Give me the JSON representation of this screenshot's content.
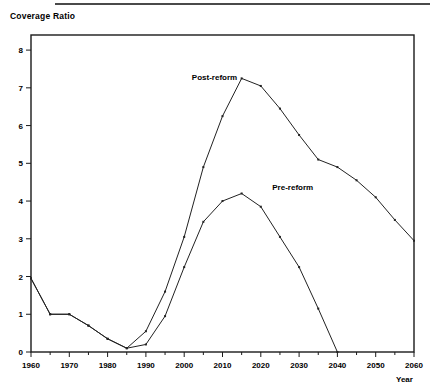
{
  "figure": {
    "y_axis_title": "Coverage Ratio",
    "x_axis_title": "Year"
  },
  "chart_data": {
    "type": "line",
    "title": "",
    "xlabel": "Year",
    "ylabel": "Coverage Ratio",
    "xlim": [
      1960,
      2060
    ],
    "ylim": [
      0,
      8.4
    ],
    "grid": false,
    "legend": "inline-annotations",
    "x_ticks": [
      1960,
      1970,
      1980,
      1990,
      2000,
      2010,
      2020,
      2030,
      2040,
      2050,
      2060
    ],
    "x_minor_ticks": [
      1965,
      1975,
      1985,
      1995,
      2005,
      2015,
      2025,
      2035,
      2045,
      2055
    ],
    "y_ticks": [
      0,
      1,
      2,
      3,
      4,
      5,
      6,
      7,
      8
    ],
    "x": [
      1960,
      1965,
      1970,
      1975,
      1980,
      1985,
      1990,
      1995,
      2000,
      2005,
      2010,
      2015,
      2020,
      2025,
      2030,
      2035,
      2040,
      2045,
      2050,
      2055,
      2060
    ],
    "series": [
      {
        "name": "Post-reform",
        "label": "Post-reform",
        "color": "#222222",
        "values": [
          1.95,
          1.0,
          1.0,
          0.7,
          0.35,
          0.1,
          0.55,
          1.6,
          3.05,
          4.9,
          6.25,
          7.25,
          7.05,
          6.45,
          5.75,
          5.1,
          4.9,
          4.55,
          4.1,
          3.5,
          2.95
        ]
      },
      {
        "name": "Pre-reform",
        "label": "Pre-reform",
        "color": "#222222",
        "values": [
          1.95,
          1.0,
          1.0,
          0.7,
          0.35,
          0.1,
          0.2,
          0.95,
          2.25,
          3.45,
          4.0,
          4.2,
          3.85,
          3.05,
          2.25,
          1.15,
          0.0,
          null,
          null,
          null,
          null
        ]
      }
    ],
    "annotations": [
      {
        "text": "Post-reform",
        "x": 2002,
        "y": 7.2
      },
      {
        "text": "Pre-reform",
        "x": 2023,
        "y": 4.3
      }
    ]
  }
}
